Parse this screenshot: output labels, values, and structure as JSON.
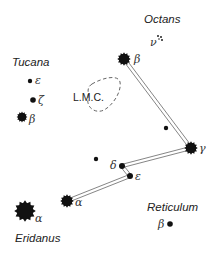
{
  "constellations": [
    {
      "name": "Tucana",
      "x": 12,
      "y": 66
    },
    {
      "name": "Octans",
      "x": 144,
      "y": 23
    },
    {
      "name": "Reticulum",
      "x": 147,
      "y": 211
    },
    {
      "name": "Eridanus",
      "x": 15,
      "y": 242
    }
  ],
  "lmc": {
    "label": "L.M.C.",
    "x": 73,
    "y": 101
  },
  "stars": [
    {
      "id": "tuc-epsilon",
      "greek": "ε",
      "x": 30,
      "y": 81,
      "r": 2.2,
      "type": "dot",
      "lx": 35,
      "ly": 84
    },
    {
      "id": "tuc-zeta",
      "greek": "ζ",
      "x": 33,
      "y": 100,
      "r": 2.8,
      "type": "dot",
      "lx": 38,
      "ly": 104
    },
    {
      "id": "tuc-beta",
      "greek": "β",
      "x": 22,
      "y": 117,
      "r": 4,
      "type": "burst",
      "lx": 29,
      "ly": 123
    },
    {
      "id": "hyi-beta",
      "greek": "β",
      "x": 124,
      "y": 59,
      "r": 5,
      "type": "burst",
      "lx": 134,
      "ly": 63
    },
    {
      "id": "hyi-gamma",
      "greek": "γ",
      "x": 191,
      "y": 148,
      "r": 5,
      "type": "burst",
      "lx": 199,
      "ly": 152
    },
    {
      "id": "hyi-delta",
      "greek": "δ",
      "x": 122,
      "y": 166,
      "r": 3,
      "type": "dot",
      "lx": 110,
      "ly": 169
    },
    {
      "id": "hyi-epsilon",
      "greek": "ε",
      "x": 130,
      "y": 176,
      "r": 3,
      "type": "dot",
      "lx": 135,
      "ly": 180
    },
    {
      "id": "hyi-alpha",
      "greek": "α",
      "x": 67,
      "y": 201,
      "r": 5,
      "type": "burst",
      "lx": 75,
      "ly": 206
    },
    {
      "id": "eri-alpha",
      "greek": "α",
      "x": 25,
      "y": 211,
      "r": 8,
      "type": "burst",
      "lx": 35,
      "ly": 222
    },
    {
      "id": "ret-beta",
      "greek": "β",
      "x": 170,
      "y": 224,
      "r": 2.8,
      "type": "dot",
      "lx": 158,
      "ly": 228
    },
    {
      "id": "field-star-1",
      "greek": "",
      "x": 96,
      "y": 159,
      "r": 2.2,
      "type": "dot"
    },
    {
      "id": "field-star-2",
      "greek": "",
      "x": 166,
      "y": 128,
      "r": 2.2,
      "type": "dot"
    }
  ],
  "octans_nu": {
    "greek": "ν",
    "x": 153,
    "y": 43
  },
  "lines": [
    {
      "from": "hyi-beta",
      "to": "hyi-gamma"
    },
    {
      "from": "hyi-gamma",
      "to": "hyi-delta"
    },
    {
      "from": "hyi-delta",
      "to": "hyi-epsilon"
    },
    {
      "from": "hyi-epsilon",
      "to": "hyi-alpha"
    }
  ]
}
